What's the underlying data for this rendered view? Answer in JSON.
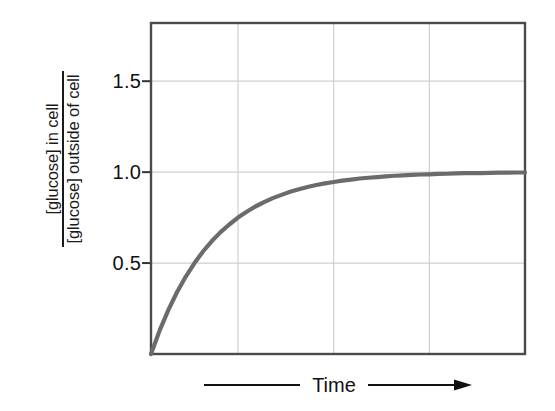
{
  "figure": {
    "background_color": "#ffffff",
    "axis_color": "#444444",
    "gridline_color": "#cfcfcf",
    "curve_color": "#6b6b6b"
  },
  "y_axis": {
    "numerator_text": "[glucose] in cell",
    "denominator_text": "[glucose] outside of cell",
    "tick_labels": [
      "1.5",
      "1.0",
      "0.5"
    ],
    "tick_values": [
      1.5,
      1.0,
      0.5
    ]
  },
  "x_axis": {
    "label": "Time",
    "arrow_icon": "right-arrow-icon"
  },
  "chart_data": {
    "type": "line",
    "title": "",
    "subtitle": "",
    "xlabel": "Time",
    "ylabel": "[glucose] in cell / [glucose] outside of cell",
    "xlim": [
      0,
      4.3
    ],
    "ylim": [
      0,
      1.82
    ],
    "grid": true,
    "legend": false,
    "legend_position": "none",
    "xticks": [],
    "xtick_labels": [],
    "x_gridlines": [
      1.0,
      2.1,
      3.2
    ],
    "yticks": [
      0.5,
      1.0,
      1.5
    ],
    "ytick_labels": [
      "0.5",
      "1.0",
      "1.5"
    ],
    "annotations": [],
    "series": [
      {
        "name": "glucose concentration ratio (facilitated diffusion)",
        "equilibrium_value": 1.0,
        "model": "1 - exp(-t/tau)",
        "tau": 0.72,
        "x": [
          0.0,
          0.1,
          0.2,
          0.3,
          0.4,
          0.5,
          0.6,
          0.7,
          0.8,
          0.9,
          1.0,
          1.1,
          1.2,
          1.3,
          1.4,
          1.5,
          1.6,
          1.7,
          1.8,
          1.9,
          2.0,
          2.1,
          2.2,
          2.3,
          2.4,
          2.5,
          2.6,
          2.7,
          2.8,
          2.9,
          3.0,
          3.1,
          3.2,
          3.3,
          3.4,
          3.5,
          3.6,
          3.7,
          3.8,
          3.9,
          4.0,
          4.1,
          4.2,
          4.3
        ],
        "values": [
          0.0,
          0.13,
          0.243,
          0.341,
          0.426,
          0.5,
          0.565,
          0.621,
          0.67,
          0.712,
          0.75,
          0.782,
          0.811,
          0.835,
          0.857,
          0.875,
          0.892,
          0.906,
          0.918,
          0.929,
          0.938,
          0.946,
          0.953,
          0.959,
          0.965,
          0.969,
          0.973,
          0.977,
          0.98,
          0.982,
          0.985,
          0.987,
          0.988,
          0.99,
          0.991,
          0.993,
          0.994,
          0.995,
          0.995,
          0.996,
          0.997,
          0.997,
          0.998,
          0.998
        ]
      }
    ]
  }
}
